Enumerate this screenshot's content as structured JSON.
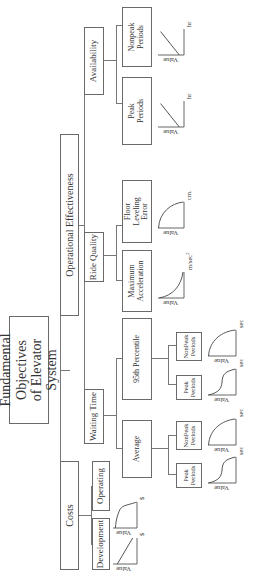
{
  "root": {
    "label": "Fundamental Objectives\nof Elevator System"
  },
  "level1": [
    {
      "label": "Costs"
    },
    {
      "label": "Operational Effectiveness"
    }
  ],
  "costs_children": [
    {
      "label": "Development"
    },
    {
      "label": "Operating"
    }
  ],
  "effectiveness_children": [
    {
      "label": "Waiting Time"
    },
    {
      "label": "Ride Quality"
    },
    {
      "label": "Availability"
    }
  ],
  "waiting_time_children": [
    {
      "label": "Average"
    },
    {
      "label": "95th Percentile"
    }
  ],
  "ride_quality_children": [
    {
      "label": "Maximum\nAcceleration"
    },
    {
      "label": "Floor\nLeveling\nError"
    }
  ],
  "availability_children": [
    {
      "label": "Peak\nPeriods"
    },
    {
      "label": "Nonpeak\nPeriods"
    }
  ],
  "average_children": [
    {
      "label": "Peak\nPeriods"
    },
    {
      "label": "NonPeak\nPeriods"
    }
  ],
  "percentile_children": [
    {
      "label": "Peak\nPeriods"
    },
    {
      "label": "NonPeak\nPeriods"
    }
  ],
  "value_functions": [
    {
      "id": "development",
      "y_label": "Value",
      "x_unit": "$",
      "shape": "linear-decreasing"
    },
    {
      "id": "operating",
      "y_label": "Value",
      "x_unit": "$",
      "shape": "concave-then-drop"
    },
    {
      "id": "avg-peak",
      "y_label": "Value",
      "x_unit": "sec",
      "shape": "s-curve-decreasing"
    },
    {
      "id": "avg-nonpeak",
      "y_label": "Value",
      "x_unit": "sec",
      "shape": "concave-decreasing"
    },
    {
      "id": "p95-peak",
      "y_label": "Value",
      "x_unit": "sec",
      "shape": "s-curve-decreasing"
    },
    {
      "id": "p95-nonpeak",
      "y_label": "Value",
      "x_unit": "sec",
      "shape": "concave-decreasing"
    },
    {
      "id": "max-acceleration",
      "y_label": "Value",
      "x_unit": "m/sec",
      "x_unit_sup": "2",
      "shape": "convex-decreasing"
    },
    {
      "id": "floor-leveling",
      "y_label": "Value",
      "x_unit": "cm.",
      "shape": "concave-decreasing"
    },
    {
      "id": "avail-peak",
      "y_label": "Value",
      "x_unit": "hr",
      "shape": "linear-increasing"
    },
    {
      "id": "avail-nonpeak",
      "y_label": "Value",
      "x_unit": "hr",
      "shape": "linear-increasing"
    }
  ]
}
